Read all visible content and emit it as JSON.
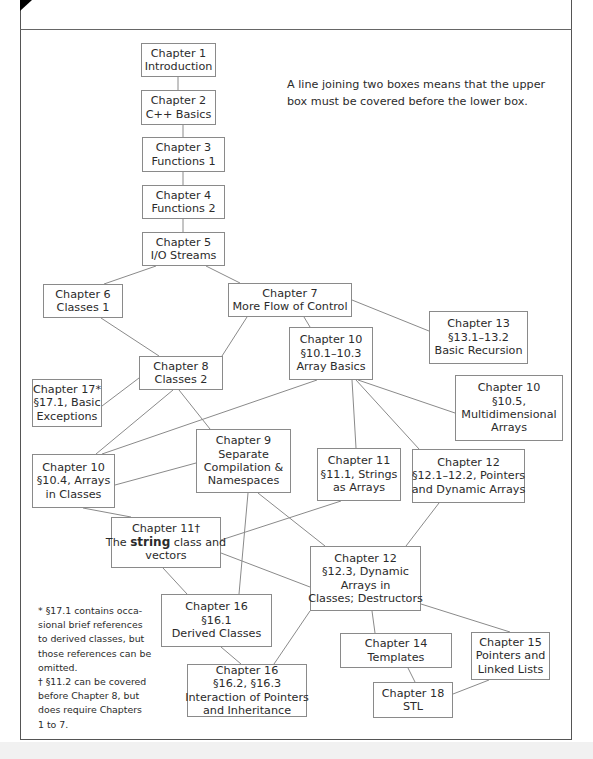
{
  "diagram": {
    "legend": {
      "line1": "A line joining two boxes means that the upper",
      "line2": "box must be covered before the lower box."
    },
    "nodes": [
      {
        "id": "ch1",
        "lines": [
          "Chapter 1",
          "Introduction"
        ]
      },
      {
        "id": "ch2",
        "lines": [
          "Chapter 2",
          "C++ Basics"
        ]
      },
      {
        "id": "ch3",
        "lines": [
          "Chapter 3",
          "Functions 1"
        ]
      },
      {
        "id": "ch4",
        "lines": [
          "Chapter 4",
          "Functions 2"
        ]
      },
      {
        "id": "ch5",
        "lines": [
          "Chapter 5",
          "I/O Streams"
        ]
      },
      {
        "id": "ch6",
        "lines": [
          "Chapter 6",
          "Classes 1"
        ]
      },
      {
        "id": "ch7",
        "lines": [
          "Chapter 7",
          "More Flow of Control"
        ]
      },
      {
        "id": "ch13",
        "lines": [
          "Chapter 13",
          "§13.1–13.2",
          "Basic Recursion"
        ]
      },
      {
        "id": "ch10a",
        "lines": [
          "Chapter 10",
          "§10.1–10.3",
          "Array Basics"
        ]
      },
      {
        "id": "ch8",
        "lines": [
          "Chapter 8",
          "Classes 2"
        ]
      },
      {
        "id": "ch17",
        "lines": [
          "Chapter 17*",
          "§17.1, Basic",
          "Exceptions"
        ]
      },
      {
        "id": "ch10c",
        "lines": [
          "Chapter 10",
          "§10.5,",
          "Multidimensional",
          "Arrays"
        ]
      },
      {
        "id": "ch9",
        "lines": [
          "Chapter 9",
          "Separate",
          "Compilation &",
          "Namespaces"
        ]
      },
      {
        "id": "ch10b",
        "lines": [
          "Chapter 10",
          "§10.4, Arrays",
          "in Classes"
        ]
      },
      {
        "id": "ch11a",
        "lines": [
          "Chapter 11",
          "§11.1, Strings",
          "as Arrays"
        ]
      },
      {
        "id": "ch12a",
        "lines": [
          "Chapter 12",
          "§12.1–12.2, Pointers",
          "and Dynamic Arrays"
        ]
      },
      {
        "id": "ch11b",
        "lines": [
          "Chapter 11†",
          "The",
          "string",
          "class and",
          "vectors"
        ]
      },
      {
        "id": "ch12b",
        "lines": [
          "Chapter 12",
          "§12.3, Dynamic",
          "Arrays in",
          "Classes; Destructors"
        ]
      },
      {
        "id": "ch16a",
        "lines": [
          "Chapter 16",
          "§16.1",
          "Derived Classes"
        ]
      },
      {
        "id": "ch14",
        "lines": [
          "Chapter 14",
          "Templates"
        ]
      },
      {
        "id": "ch15",
        "lines": [
          "Chapter 15",
          "Pointers and",
          "Linked Lists"
        ]
      },
      {
        "id": "ch16b",
        "lines": [
          "Chapter 16",
          "§16.2, §16.3",
          "Interaction of Pointers",
          "and Inheritance"
        ]
      },
      {
        "id": "ch18",
        "lines": [
          "Chapter 18",
          "STL"
        ]
      }
    ],
    "edges": [
      [
        "ch1",
        "ch2"
      ],
      [
        "ch2",
        "ch3"
      ],
      [
        "ch3",
        "ch4"
      ],
      [
        "ch4",
        "ch5"
      ],
      [
        "ch5",
        "ch6"
      ],
      [
        "ch5",
        "ch7"
      ],
      [
        "ch6",
        "ch8"
      ],
      [
        "ch7",
        "ch8"
      ],
      [
        "ch7",
        "ch10a"
      ],
      [
        "ch7",
        "ch13"
      ],
      [
        "ch8",
        "ch17"
      ],
      [
        "ch8",
        "ch10b"
      ],
      [
        "ch8",
        "ch9"
      ],
      [
        "ch10a",
        "ch10b"
      ],
      [
        "ch10a",
        "ch11a"
      ],
      [
        "ch10a",
        "ch12a"
      ],
      [
        "ch10a",
        "ch10c"
      ],
      [
        "ch9",
        "ch10b"
      ],
      [
        "ch9",
        "ch12b"
      ],
      [
        "ch9",
        "ch16a"
      ],
      [
        "ch10b",
        "ch11b"
      ],
      [
        "ch11a",
        "ch11b"
      ],
      [
        "ch11b",
        "ch16a"
      ],
      [
        "ch11b",
        "ch12b"
      ],
      [
        "ch12a",
        "ch12b"
      ],
      [
        "ch12b",
        "ch14"
      ],
      [
        "ch12b",
        "ch15"
      ],
      [
        "ch12b",
        "ch16b"
      ],
      [
        "ch16a",
        "ch16b"
      ],
      [
        "ch14",
        "ch18"
      ],
      [
        "ch15",
        "ch18"
      ]
    ],
    "footnotes": {
      "lines": [
        "* §17.1 contains occa-",
        "sional brief references",
        "to derived classes, but",
        "those references can be",
        "omitted.",
        "† §11.2 can be covered",
        "before Chapter 8, but",
        "does require Chapters",
        "1 to 7."
      ]
    }
  }
}
